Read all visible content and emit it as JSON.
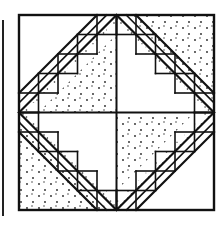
{
  "figure": {
    "title": "Quilt block line drawing",
    "colors": {
      "background": "#ffffff",
      "line": "#111111",
      "dot": "#222222"
    },
    "block": {
      "x": 19,
      "y": 15,
      "size": 195
    },
    "grid_units": 10,
    "left_bar": {
      "x": 2,
      "y": 20,
      "width": 2,
      "height": 196
    }
  }
}
